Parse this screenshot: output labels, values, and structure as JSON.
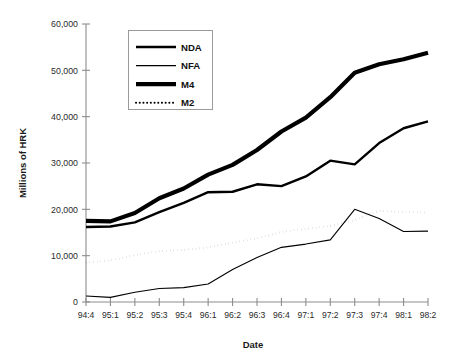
{
  "chart_data": {
    "type": "line",
    "title": "",
    "xlabel": "Date",
    "ylabel": "Millions of HRK",
    "ylim": [
      0,
      60000
    ],
    "yticks": [
      0,
      10000,
      20000,
      30000,
      40000,
      50000,
      60000
    ],
    "ytick_labels": [
      "0",
      "10,000",
      "20,000",
      "30,000",
      "40,000",
      "50,000",
      "60,000"
    ],
    "grid": false,
    "legend_position": "upper-left-inside",
    "categories": [
      "94:4",
      "95:1",
      "95:2",
      "95:3",
      "95:4",
      "96:1",
      "96:2",
      "96:3",
      "96:4",
      "97:1",
      "97:2",
      "97:3",
      "97:4",
      "98:1",
      "98:2"
    ],
    "series": [
      {
        "name": "NDA",
        "style": "solid-medium",
        "values": [
          16200,
          16300,
          17200,
          19400,
          21400,
          23700,
          23800,
          25400,
          25000,
          27100,
          30500,
          29700,
          34300,
          37500,
          39000
        ]
      },
      {
        "name": "NFA",
        "style": "solid-thin",
        "values": [
          1300,
          1000,
          2100,
          2900,
          3100,
          3900,
          7000,
          9600,
          11800,
          12500,
          13400,
          20000,
          18000,
          15200,
          15300
        ]
      },
      {
        "name": "M4",
        "style": "solid-thick",
        "values": [
          17500,
          17400,
          19200,
          22400,
          24500,
          27500,
          29600,
          32800,
          36800,
          39800,
          44200,
          49500,
          51300,
          52400,
          53800
        ]
      },
      {
        "name": "M2",
        "style": "dotted",
        "values": [
          8500,
          9000,
          10100,
          11000,
          11200,
          11800,
          12800,
          13700,
          15100,
          15800,
          16400,
          17700,
          19700,
          19400,
          19300
        ]
      }
    ]
  },
  "legend": {
    "entries": [
      {
        "label": "NDA"
      },
      {
        "label": "NFA"
      },
      {
        "label": "M4"
      },
      {
        "label": "M2"
      }
    ]
  }
}
